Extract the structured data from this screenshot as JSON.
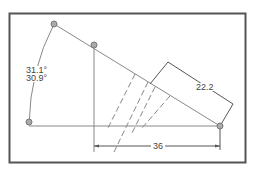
{
  "diagram": {
    "type": "geometry-dimension-drawing",
    "frame": {
      "stroke": "#555555"
    },
    "colors": {
      "line": "#888888",
      "dimension": "#555555",
      "point_fill": "#aaaaaa",
      "point_stroke": "#777777",
      "text": "#444444"
    },
    "points": [
      {
        "id": "A",
        "x": 54,
        "y": 24
      },
      {
        "id": "B",
        "x": 94,
        "y": 45
      },
      {
        "id": "C",
        "x": 29,
        "y": 125
      },
      {
        "id": "D",
        "x": 220,
        "y": 126
      }
    ],
    "angle_labels": {
      "upper": "31.1°",
      "lower": "30.9°"
    },
    "dimensions": {
      "horizontal": "36",
      "slanted": "22.2"
    }
  }
}
